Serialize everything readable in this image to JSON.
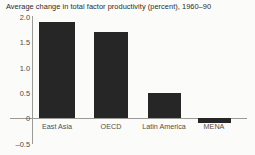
{
  "chart_data": {
    "type": "bar",
    "title": "Average change in total factor productivity (percent), 1960–90",
    "xlabel": "",
    "ylabel": "",
    "categories": [
      "East Asia",
      "OECD",
      "Latin America",
      "MENA"
    ],
    "values": [
      1.9,
      1.7,
      0.5,
      -0.1
    ],
    "ylim": [
      -0.5,
      2.0
    ],
    "yticks": [
      2.0,
      1.5,
      1.0,
      0.5,
      0,
      -0.5
    ],
    "ytick_labels": [
      "2.0",
      "1.5",
      "1.0",
      "0.5",
      "0",
      "–0.5"
    ],
    "grid": false,
    "legend": false,
    "bar_color": "#262626",
    "axis_color": "#9a9a98",
    "background_color": "#fbfbf9",
    "text_color": "#4a4a4a"
  }
}
